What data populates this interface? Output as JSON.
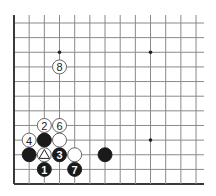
{
  "board": {
    "description": "Go board corner diagram (lower-left corner), open on top and right",
    "columns": 13,
    "rows": 12,
    "edges": [
      "left",
      "bottom"
    ],
    "origin_x": 14,
    "origin_y": 23,
    "col_spacing": 15.17,
    "row_spacing": 14.64,
    "line_color": "#8a8a8a",
    "edge_color": "#3a3a3a",
    "star_points": [
      {
        "col": 3,
        "row": 2
      },
      {
        "col": 9,
        "row": 2
      },
      {
        "col": 9,
        "row": 8
      }
    ]
  },
  "stones": [
    {
      "color": "black",
      "col": 2,
      "row": 10,
      "label": "1"
    },
    {
      "color": "white",
      "col": 2,
      "row": 7,
      "label": "2"
    },
    {
      "color": "black",
      "col": 3,
      "row": 9,
      "label": "3"
    },
    {
      "color": "white",
      "col": 1,
      "row": 8,
      "label": "4"
    },
    {
      "color": "white",
      "col": 3,
      "row": 7,
      "label": "6"
    },
    {
      "color": "black",
      "col": 4,
      "row": 10,
      "label": "7"
    },
    {
      "color": "white",
      "col": 3,
      "row": 3,
      "label": "8"
    },
    {
      "color": "black",
      "col": 2,
      "row": 8,
      "label": ""
    },
    {
      "color": "white",
      "col": 3,
      "row": 8,
      "label": ""
    },
    {
      "color": "black",
      "col": 1,
      "row": 9,
      "label": ""
    },
    {
      "color": "white",
      "col": 2,
      "row": 9,
      "label": "",
      "marker": "triangle"
    },
    {
      "color": "white",
      "col": 4,
      "row": 9,
      "label": ""
    },
    {
      "color": "black",
      "col": 6,
      "row": 9,
      "label": ""
    }
  ]
}
